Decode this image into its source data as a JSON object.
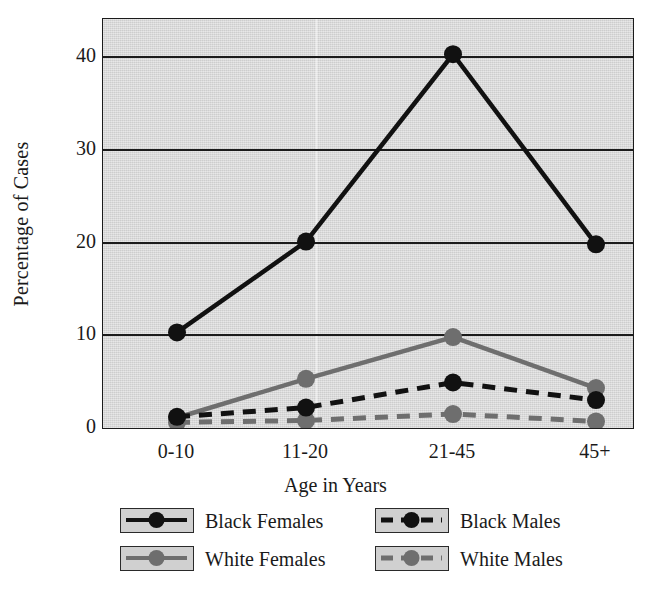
{
  "chart_data": {
    "type": "line",
    "title": "",
    "xlabel": "Age in Years",
    "ylabel": "Percentage of Cases",
    "categories": [
      "0-10",
      "11-20",
      "21-45",
      "45+"
    ],
    "ylim": [
      0,
      44
    ],
    "yticks": [
      0,
      10,
      20,
      30,
      40
    ],
    "ytick_labels": [
      "0",
      "10",
      "20",
      "30",
      "40"
    ],
    "grid": true,
    "legend_position": "bottom",
    "series": [
      {
        "name": "Black Females",
        "values": [
          10.2,
          20.0,
          40.2,
          19.7
        ],
        "color": "#111111",
        "dash": "solid",
        "marker": "circle"
      },
      {
        "name": "White Females",
        "values": [
          1.0,
          5.2,
          9.7,
          4.2
        ],
        "color": "#6e6e6e",
        "dash": "solid",
        "marker": "circle"
      },
      {
        "name": "Black Males",
        "values": [
          1.1,
          2.1,
          4.8,
          2.9
        ],
        "color": "#111111",
        "dash": "dashed",
        "marker": "circle"
      },
      {
        "name": "White Males",
        "values": [
          0.5,
          0.7,
          1.4,
          0.6
        ],
        "color": "#6e6e6e",
        "dash": "dashed",
        "marker": "circle"
      }
    ]
  },
  "legend": {
    "entries": [
      {
        "label": "Black Females"
      },
      {
        "label": "White Females"
      },
      {
        "label": "Black Males"
      },
      {
        "label": "White Males"
      }
    ]
  },
  "axes": {
    "y_title": "Percentage of Cases",
    "x_title": "Age in Years"
  },
  "colors": {
    "plot_background": "#d9d9d9",
    "axis": "#1b1b1b",
    "black_series": "#111111",
    "gray_series": "#6e6e6e",
    "legend_swatch": "#d0d0d0"
  }
}
